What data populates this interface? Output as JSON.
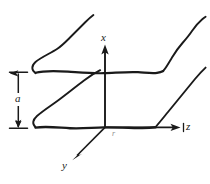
{
  "figure": {
    "type": "engineering-diagram",
    "background_color": "#ffffff",
    "ink_color": "#1a1a1a",
    "labels": {
      "x_axis": "x",
      "y_axis": "y",
      "z_axis": "z",
      "separation": "a",
      "origin": "r"
    },
    "axes": {
      "origin": [
        105,
        127
      ],
      "x_axis_tip": [
        105,
        44
      ],
      "z_axis_tip": [
        180,
        127
      ],
      "y_axis_tip": [
        72,
        160
      ]
    },
    "dimension": {
      "label": "a",
      "top_y": 72,
      "bottom_y": 128,
      "line_x": 18,
      "tick_half_width": 8
    },
    "plates": [
      {
        "name": "upper-plate",
        "front_edge_y": 72,
        "front_edge_x_range": [
          35,
          163
        ],
        "left_depth_edge": [
          [
            35,
            72
          ],
          [
            93,
            15
          ]
        ],
        "right_depth_edge": [
          [
            163,
            72
          ],
          [
            205,
            18
          ]
        ]
      },
      {
        "name": "lower-plate",
        "front_edge_y": 127,
        "front_edge_x_range": [
          35,
          155
        ],
        "left_depth_edge": [
          [
            35,
            127
          ],
          [
            100,
            70
          ]
        ],
        "right_depth_edge": [
          [
            155,
            127
          ],
          [
            205,
            68
          ]
        ]
      }
    ]
  }
}
